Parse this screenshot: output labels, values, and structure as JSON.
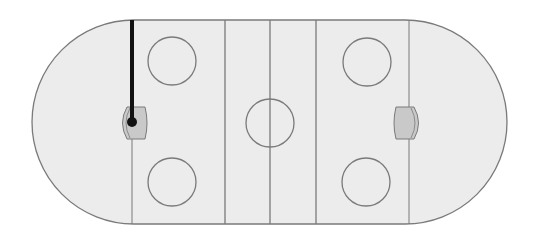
{
  "diagram": {
    "type": "hockey-rink",
    "title": "",
    "colors": {
      "ice": "#ececec",
      "line": "#7a7a7a",
      "crease_fill": "#c9c9c9",
      "marker": "#111111",
      "background": "#ffffff"
    },
    "rink": {
      "x": 32,
      "y": 20,
      "width": 475,
      "height": 204,
      "end_radius": 102
    },
    "lines": {
      "left_goal_line_x": 132,
      "left_blue_line_x": 225,
      "center_line_x": 270,
      "right_blue_line_x": 316,
      "right_goal_line_x": 409
    },
    "circles": [
      {
        "name": "left-top-faceoff-circle",
        "cx": 172,
        "cy": 61,
        "r": 24
      },
      {
        "name": "left-bottom-faceoff-circle",
        "cx": 172,
        "cy": 182,
        "r": 24
      },
      {
        "name": "center-circle",
        "cx": 270,
        "cy": 123,
        "r": 24
      },
      {
        "name": "right-top-faceoff-circle",
        "cx": 367,
        "cy": 62,
        "r": 24
      },
      {
        "name": "right-bottom-faceoff-circle",
        "cx": 366,
        "cy": 182,
        "r": 24
      }
    ],
    "creases": [
      {
        "name": "left-goal-crease",
        "x": 132,
        "y": 123
      },
      {
        "name": "right-goal-crease",
        "x": 409,
        "y": 123
      }
    ],
    "marker": {
      "label": "",
      "x": 132,
      "y_start": 20,
      "y_end": 122,
      "dot_radius": 5
    }
  }
}
